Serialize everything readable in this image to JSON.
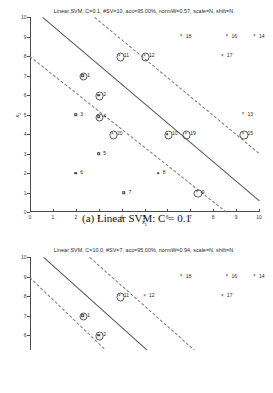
{
  "figure_a": {
    "caption": "(a) Linear SVM: C = 0.1",
    "chart_data": {
      "type": "scatter",
      "title": "Linear SVM, C=0.1, #SV=10, acc=95.00%, normW=0.57, scale=N, shift=N",
      "xlabel": "x1",
      "ylabel": "x2",
      "xlim": [
        0,
        10
      ],
      "ylim": [
        0,
        10
      ],
      "xticks": [
        0,
        1,
        2,
        3,
        4,
        5,
        6,
        7,
        8,
        9,
        10
      ],
      "yticks": [
        0,
        1,
        2,
        3,
        4,
        5,
        6,
        7,
        8,
        9,
        10
      ],
      "grid": false,
      "legend": "none",
      "params": {
        "model": "Linear SVM",
        "C": "0.1",
        "num_SV": "10",
        "acc": "95.00%",
        "normW": "0.57",
        "scale": "N",
        "shift": "N"
      },
      "lines": [
        {
          "name": "decision-boundary",
          "style": "solid",
          "x": [
            0.55,
            10.0
          ],
          "y": [
            10.0,
            0.6
          ]
        },
        {
          "name": "upper-margin",
          "style": "dashed",
          "x": [
            2.85,
            10.0
          ],
          "y": [
            10.0,
            3.05
          ]
        },
        {
          "name": "lower-margin",
          "style": "dashed",
          "x": [
            0.0,
            8.6
          ],
          "y": [
            8.0,
            0.0
          ]
        }
      ],
      "points": [
        {
          "label": "1",
          "x": 2.3,
          "y": 7,
          "marker": "square",
          "support_vector": true
        },
        {
          "label": "2",
          "x": 3.0,
          "y": 6,
          "marker": "square",
          "support_vector": true
        },
        {
          "label": "3",
          "x": 2.0,
          "y": 5,
          "marker": "square",
          "support_vector": false
        },
        {
          "label": "4",
          "x": 3.0,
          "y": 4.9,
          "marker": "square",
          "support_vector": true
        },
        {
          "label": "5",
          "x": 3.0,
          "y": 3,
          "marker": "square",
          "support_vector": false
        },
        {
          "label": "6",
          "x": 2.0,
          "y": 2,
          "marker": "square",
          "support_vector": false
        },
        {
          "label": "7",
          "x": 4.1,
          "y": 1,
          "marker": "square",
          "support_vector": false
        },
        {
          "label": "8",
          "x": 5.6,
          "y": 2,
          "marker": "square",
          "support_vector": false
        },
        {
          "label": "9",
          "x": 7.3,
          "y": 1,
          "marker": "x",
          "support_vector": true
        },
        {
          "label": "10",
          "x": 6.0,
          "y": 4,
          "marker": "square",
          "support_vector": true
        },
        {
          "label": "11",
          "x": 3.9,
          "y": 8,
          "marker": "x",
          "support_vector": true
        },
        {
          "label": "12",
          "x": 5.0,
          "y": 8,
          "marker": "x",
          "support_vector": true
        },
        {
          "label": "13",
          "x": 9.3,
          "y": 5,
          "marker": "x",
          "support_vector": false
        },
        {
          "label": "14",
          "x": 9.8,
          "y": 9,
          "marker": "x",
          "support_vector": false
        },
        {
          "label": "15",
          "x": 9.3,
          "y": 4,
          "marker": "x",
          "support_vector": true
        },
        {
          "label": "16",
          "x": 8.6,
          "y": 9,
          "marker": "x",
          "support_vector": false
        },
        {
          "label": "17",
          "x": 8.4,
          "y": 8,
          "marker": "x",
          "support_vector": false
        },
        {
          "label": "18",
          "x": 6.6,
          "y": 9,
          "marker": "x",
          "support_vector": false
        },
        {
          "label": "19",
          "x": 6.8,
          "y": 4,
          "marker": "x",
          "support_vector": true
        },
        {
          "label": "20",
          "x": 3.6,
          "y": 4,
          "marker": "x",
          "support_vector": true
        }
      ]
    }
  },
  "figure_b": {
    "chart_data": {
      "type": "scatter",
      "title": "Linear SVM, C=10.0, #SV=7, acc=95.00%, normW=0.94, scale=N, shift=N",
      "xlabel": "x1",
      "ylabel": "x2",
      "xlim": [
        0,
        10
      ],
      "ylim": [
        0,
        10
      ],
      "yticks": [
        5,
        6,
        7,
        8,
        9,
        10
      ],
      "grid": false,
      "legend": "none",
      "params": {
        "model": "Linear SVM",
        "C": "10.0",
        "num_SV": "7",
        "acc": "95.00%",
        "normW": "0.94",
        "scale": "N",
        "shift": "N"
      },
      "lines": [
        {
          "name": "decision-boundary",
          "style": "solid",
          "x": [
            0.6,
            10.0
          ],
          "y": [
            10.0,
            0.1
          ]
        },
        {
          "name": "upper-margin",
          "style": "dashed",
          "x": [
            2.6,
            10.0
          ],
          "y": [
            10.0,
            2.3
          ]
        },
        {
          "name": "lower-margin",
          "style": "dashed",
          "x": [
            0.0,
            8.0
          ],
          "y": [
            9.0,
            0.0
          ]
        }
      ],
      "points": [
        {
          "label": "1",
          "x": 2.3,
          "y": 7,
          "marker": "square",
          "support_vector": true
        },
        {
          "label": "2",
          "x": 3.0,
          "y": 6,
          "marker": "square",
          "support_vector": true
        },
        {
          "label": "11",
          "x": 3.9,
          "y": 8,
          "marker": "x",
          "support_vector": true
        },
        {
          "label": "12",
          "x": 5.0,
          "y": 8,
          "marker": "x",
          "support_vector": false
        },
        {
          "label": "14",
          "x": 9.8,
          "y": 9,
          "marker": "x",
          "support_vector": false
        },
        {
          "label": "16",
          "x": 8.6,
          "y": 9,
          "marker": "x",
          "support_vector": false
        },
        {
          "label": "17",
          "x": 8.4,
          "y": 8,
          "marker": "x",
          "support_vector": false
        },
        {
          "label": "18",
          "x": 6.6,
          "y": 9,
          "marker": "x",
          "support_vector": false
        }
      ]
    }
  }
}
